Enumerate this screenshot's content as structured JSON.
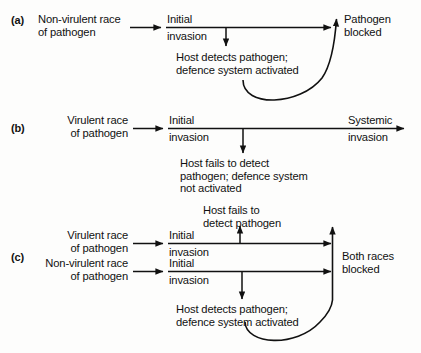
{
  "figure": {
    "type": "flow-diagram",
    "ink_color": "#111111",
    "background_color": "#fdfdfc"
  },
  "panels": [
    {
      "letter": "(a)",
      "source": "Non-virulent race\nof pathogen",
      "step": {
        "above": "Initial",
        "below": "invasion"
      },
      "branch": "Host detects pathogen;\ndefence system activated",
      "outcome": "Pathogen\nblocked"
    },
    {
      "letter": "(b)",
      "source": "Virulent race\nof pathogen",
      "step": {
        "above": "Initial",
        "below": "invasion"
      },
      "branch": "Host fails to detect\npathogen; defence system\nnot activated",
      "outcome": {
        "above": "Systemic",
        "below": "invasion"
      }
    },
    {
      "letter": "(c)",
      "source_top": "Virulent race\nof pathogen",
      "source_bottom": "Non-virulent race\nof pathogen",
      "step_top": {
        "above": "Initial",
        "below": "invasion"
      },
      "step_bottom": {
        "above": "Initial",
        "below": "invasion"
      },
      "branch_up": "Host fails to\ndetect pathogen",
      "branch_down": "Host detects pathogen;\ndefence system activated",
      "outcome": "Both races\nblocked"
    }
  ]
}
